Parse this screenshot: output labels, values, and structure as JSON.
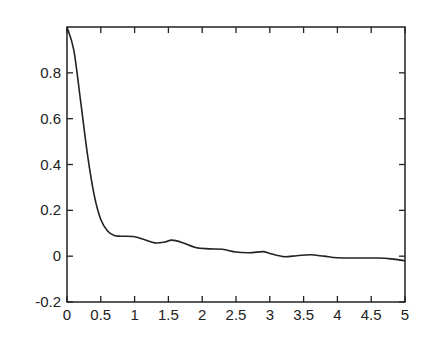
{
  "chart_data": {
    "type": "line",
    "title": "",
    "xlabel": "",
    "ylabel": "",
    "xlim": [
      0,
      5
    ],
    "ylim": [
      -0.2,
      1.0
    ],
    "grid": false,
    "legend": null,
    "xticks": [
      "0",
      "0.5",
      "1",
      "1.5",
      "2",
      "2.5",
      "3",
      "3.5",
      "4",
      "4.5",
      "5"
    ],
    "yticks": [
      "-0.2",
      "0",
      "0.2",
      "0.4",
      "0.6",
      "0.8"
    ],
    "series": [
      {
        "name": "curve",
        "color": "#222222",
        "x": [
          0,
          0.1,
          0.2,
          0.3,
          0.4,
          0.5,
          0.6,
          0.7,
          0.8,
          1.0,
          1.15,
          1.3,
          1.45,
          1.55,
          1.7,
          1.9,
          2.1,
          2.3,
          2.5,
          2.7,
          2.9,
          3.0,
          3.2,
          3.4,
          3.6,
          3.8,
          4.0,
          4.3,
          4.6,
          4.8,
          5.0
        ],
        "values": [
          1.0,
          0.9,
          0.68,
          0.45,
          0.27,
          0.16,
          0.11,
          0.09,
          0.087,
          0.085,
          0.072,
          0.058,
          0.062,
          0.07,
          0.06,
          0.038,
          0.032,
          0.03,
          0.018,
          0.015,
          0.02,
          0.012,
          -0.002,
          0.002,
          0.006,
          0.0,
          -0.007,
          -0.008,
          -0.008,
          -0.012,
          -0.02
        ]
      }
    ]
  }
}
